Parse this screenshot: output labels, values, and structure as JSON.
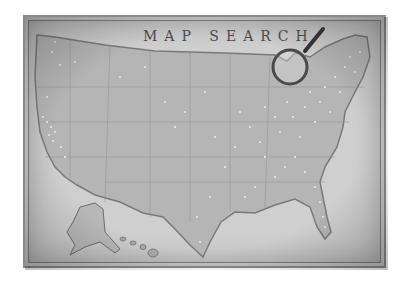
{
  "map": {
    "title": "MAP SEARCH",
    "style": "vintage grayscale",
    "region": "United States",
    "insets": [
      "Alaska",
      "Hawaii"
    ],
    "marker_color": "#f4f4f4",
    "background_color": "#cfcfcf",
    "land_color": "#b5b5b5",
    "border_color": "#7d7d7d"
  },
  "magnifier": {
    "icon": "magnifying-glass-icon"
  },
  "ticks": [
    "",
    "",
    "",
    "",
    "",
    "",
    "",
    "",
    "",
    "",
    "",
    "",
    "",
    "",
    ""
  ]
}
